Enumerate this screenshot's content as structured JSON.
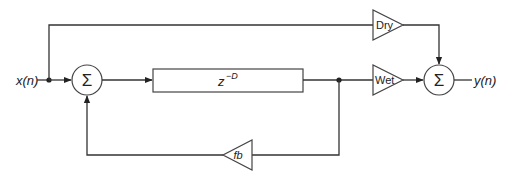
{
  "diagram": {
    "type": "signal-flow",
    "input_label": "x(n)",
    "output_label": "y(n)",
    "nodes": {
      "sum_input": {
        "symbol": "Σ",
        "kind": "summer"
      },
      "delay": {
        "label_base": "z",
        "label_exp": "−D",
        "kind": "delay-line"
      },
      "dry_gain": {
        "label": "Dry",
        "kind": "gain"
      },
      "wet_gain": {
        "label": "Wet",
        "kind": "gain"
      },
      "fb_gain": {
        "label": "fb",
        "kind": "gain"
      },
      "sum_output": {
        "symbol": "Σ",
        "kind": "summer"
      }
    },
    "edges": [
      {
        "from": "x(n)",
        "to": "sum_input"
      },
      {
        "from": "x(n)",
        "to": "dry_gain"
      },
      {
        "from": "sum_input",
        "to": "delay"
      },
      {
        "from": "delay",
        "to": "wet_gain"
      },
      {
        "from": "delay",
        "to": "fb_gain"
      },
      {
        "from": "fb_gain",
        "to": "sum_input"
      },
      {
        "from": "dry_gain",
        "to": "sum_output"
      },
      {
        "from": "wet_gain",
        "to": "sum_output"
      },
      {
        "from": "sum_output",
        "to": "y(n)"
      }
    ],
    "colors": {
      "line": "#333333",
      "background": "#ffffff"
    }
  }
}
